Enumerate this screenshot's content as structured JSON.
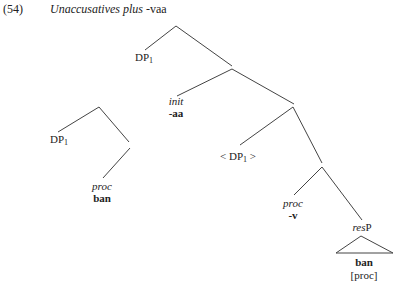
{
  "example": {
    "number": "(54)",
    "title_italic": "Unaccusatives plus",
    "title_suffix": "-vaa"
  },
  "tree": {
    "top_spec": {
      "label": "DP",
      "sub": "1"
    },
    "init_head": {
      "category": "init",
      "form": "-aa"
    },
    "lower_spec": {
      "label": "< DP",
      "sub": "1",
      "close": " >"
    },
    "proc_head": {
      "category": "proc",
      "form": "-v"
    },
    "resP": {
      "italic": "res",
      "plain": "P",
      "content": "ban",
      "feature": "[proc]"
    }
  },
  "left_tree": {
    "spec": {
      "label": "DP",
      "sub": "1"
    },
    "head": {
      "category": "proc",
      "form": "ban"
    }
  }
}
